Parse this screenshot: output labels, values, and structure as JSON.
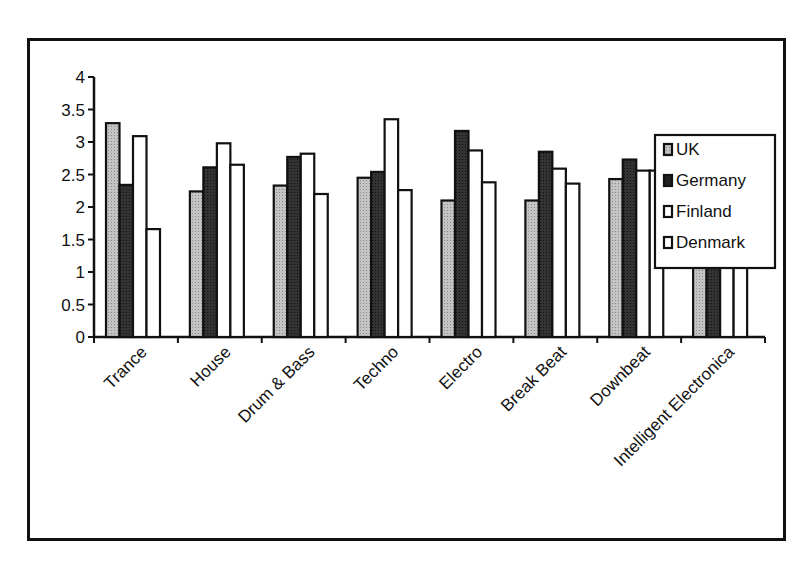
{
  "chart_data": {
    "type": "bar",
    "title": "",
    "xlabel": "",
    "ylabel": "",
    "ylim": [
      0,
      4
    ],
    "yticks": [
      "0",
      "0.5",
      "1",
      "1.5",
      "2",
      "2.5",
      "3",
      "3.5",
      "4"
    ],
    "grid": false,
    "legend_position": "right",
    "categories": [
      "Trance",
      "House",
      "Drum & Bass",
      "Techno",
      "Electro",
      "Break Beat",
      "Downbeat",
      "Intelligent Electronica"
    ],
    "series": [
      {
        "name": "UK",
        "color": "#b8b8b8",
        "values": [
          3.29,
          2.24,
          2.33,
          2.45,
          2.1,
          2.1,
          2.43,
          2.24
        ]
      },
      {
        "name": "Germany",
        "color": "#2e2e2e",
        "values": [
          2.34,
          2.61,
          2.77,
          2.54,
          3.17,
          2.85,
          2.73,
          3.05
        ]
      },
      {
        "name": "Finland",
        "color": "#ffffff",
        "values": [
          3.09,
          2.98,
          2.82,
          3.35,
          2.87,
          2.59,
          2.56,
          2.44
        ]
      },
      {
        "name": "Denmark",
        "color": "#ffffff",
        "values": [
          1.66,
          2.65,
          2.2,
          2.26,
          2.38,
          2.36,
          2.56,
          2.36
        ]
      }
    ]
  },
  "legend": {
    "items": [
      "UK",
      "Germany",
      "Finland",
      "Denmark"
    ]
  }
}
